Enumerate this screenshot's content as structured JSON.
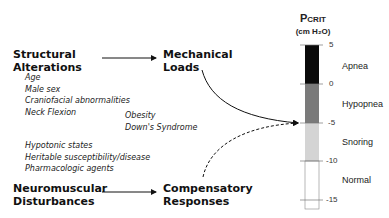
{
  "left": {
    "structural": {
      "line1": "Structural",
      "line2": "Alterations"
    },
    "structural_items": [
      "Age",
      "Male sex",
      "Craniofacial abnormalities",
      "Neck Flexion"
    ],
    "middle_items": [
      "Obesity",
      "Down's Syndrome"
    ],
    "neuro_items": [
      "Hypotonic states",
      "Heritable susceptibility/disease",
      "Pharmacologic agents"
    ],
    "neuromuscular": {
      "line1": "Neuromuscular",
      "line2": "Disturbances"
    }
  },
  "middle": {
    "mechanical": {
      "line1": "Mechanical",
      "line2": "Loads"
    },
    "compensatory": {
      "line1": "Compensatory",
      "line2": "Responses"
    }
  },
  "scale": {
    "title_main": "P",
    "title_sub": "CRIT",
    "unit": "(cm H₂O)",
    "ticks": [
      "5",
      "0",
      "-5",
      "-10",
      "-15"
    ],
    "zones": [
      {
        "label": "Apnea",
        "color": "#0a0a0a"
      },
      {
        "label": "Hypopnea",
        "color": "#7a7a7a"
      },
      {
        "label": "Snoring",
        "color": "#d4d4d4"
      },
      {
        "label": "Normal",
        "color": "#ffffff"
      }
    ]
  }
}
